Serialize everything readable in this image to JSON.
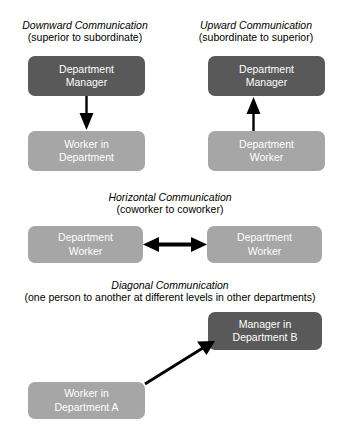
{
  "diagram": {
    "sections": [
      {
        "id": "downward",
        "title": "Downward Communication",
        "subtitle": "(superior to subordinate)",
        "from": "Department\nManager",
        "to": "Worker in\nDepartment",
        "arrow": "down-arrow"
      },
      {
        "id": "upward",
        "title": "Upward Communication",
        "subtitle": "(subordinate to superior)",
        "from": "Department\nWorker",
        "to": "Department\nManager",
        "arrow": "up-arrow"
      },
      {
        "id": "horizontal",
        "title": "Horizontal Communication",
        "subtitle": "(coworker to coworker)",
        "from": "Department\nWorker",
        "to": "Department\nWorker",
        "arrow": "double-headed-horizontal-arrow"
      },
      {
        "id": "diagonal",
        "title": "Diagonal Communication",
        "subtitle": "(one person to another at different levels in other departments)",
        "from": "Worker in\nDepartment A",
        "to": "Manager in\nDepartment B",
        "arrow": "diagonal-up-right-arrow"
      }
    ],
    "nodes": {
      "downward_manager": "Department\nManager",
      "downward_worker": "Worker in\nDepartment",
      "upward_manager": "Department\nManager",
      "upward_worker": "Department\nWorker",
      "horizontal_left": "Department\nWorker",
      "horizontal_right": "Department\nWorker",
      "diagonal_manager": "Manager in\nDepartment B",
      "diagonal_worker": "Worker in\nDepartment A"
    },
    "colors": {
      "manager_box": "#595959",
      "worker_box": "#a6a6a6",
      "node_text": "#ffffff",
      "arrow": "#000000",
      "background": "#ffffff",
      "heading_text": "#000000"
    }
  }
}
